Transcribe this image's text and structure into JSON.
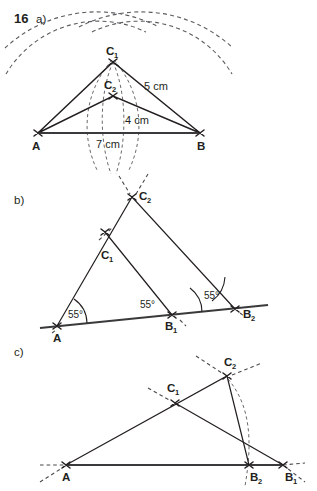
{
  "exercise": {
    "number": "16",
    "parts": [
      {
        "id": "a",
        "label": "a)"
      },
      {
        "id": "b",
        "label": "b)"
      },
      {
        "id": "c",
        "label": "c)"
      }
    ]
  },
  "part_a": {
    "caption": "a)",
    "points": {
      "A": "A",
      "B": "B",
      "C1": "C",
      "C1_sub": "1",
      "C2": "C",
      "C2_sub": "2"
    },
    "dimensions": {
      "base": "7 cm",
      "side_long": "5 cm",
      "side_short": "4 cm"
    }
  },
  "part_b": {
    "caption": "b)",
    "points": {
      "A": "A",
      "B1": "B",
      "B1_sub": "1",
      "B2": "B",
      "B2_sub": "2",
      "C1": "C",
      "C1_sub": "1",
      "C2": "C",
      "C2_sub": "2"
    },
    "angles": [
      "55°",
      "55°",
      "55°"
    ]
  },
  "part_c": {
    "caption": "c)",
    "points": {
      "A": "A",
      "B1": "B",
      "B1_sub": "1",
      "B2": "B",
      "B2_sub": "2",
      "C1": "C",
      "C1_sub": "1",
      "C2": "C",
      "C2_sub": "2"
    }
  },
  "colors": {
    "ink": "#231f20",
    "construction": "#5c5c60",
    "background": "#ffffff"
  }
}
